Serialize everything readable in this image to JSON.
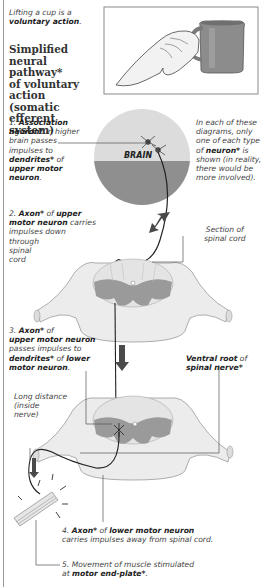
{
  "intro": {
    "line1": "Lifting a cup is a",
    "line2_bold": "voluntary action",
    "line2_end": "."
  },
  "title": {
    "lines": [
      "Simplified",
      "neural pathway*",
      "of voluntary",
      "action (somatic",
      "efferent system)"
    ]
  },
  "brain_label": "BRAIN",
  "note": {
    "l1": "In each of these",
    "l2": "diagrams, only",
    "l3": "one of each type",
    "l4_pre": "of ",
    "l4_bold": "neuron*",
    "l4_post": " is",
    "l5": "shown (in reality,",
    "l6": "there would be",
    "l7": "more involved)."
  },
  "step1": {
    "num": "1. ",
    "b1": "Association",
    "b2": "neuron*",
    "t2": " in higher",
    "t3": "brain passes",
    "t4": "impulses to",
    "b5": "dendrites*",
    "t5": " of",
    "b6": "upper motor",
    "b7": "neuron",
    "t7": "."
  },
  "step2": {
    "num": "2. ",
    "b1": "Axon*",
    "t1": " of ",
    "b1b": "upper",
    "b2": "motor neuron",
    "t2": " carries",
    "t3": "impulses down",
    "t4": "through",
    "t5": "spinal",
    "t6": "cord"
  },
  "section_label": {
    "l1": "Section of",
    "l2": "spinal cord"
  },
  "step3": {
    "num": "3. ",
    "b1": "Axon*",
    "t1": " of",
    "b2": "upper motor neuron",
    "t3": "passes impulses to",
    "b4": "dendrites*",
    "t4": " of ",
    "b4b": "lower",
    "b5": "motor neuron",
    "t5": "."
  },
  "ventral": {
    "b1": "Ventral root",
    "t1": " of",
    "b2": "spinal nerve*"
  },
  "long_distance": {
    "l1": "Long distance",
    "l2": "(inside",
    "l3": "nerve)"
  },
  "step4": {
    "num": "4. ",
    "b1": "Axon*",
    "t1": " of ",
    "b2": "lower motor neuron",
    "t2": "carries impulses away from spinal cord."
  },
  "step5": {
    "t1": "5. Movement of muscle stimulated",
    "t2": "at ",
    "b2": "motor end-plate*",
    "t2end": "."
  },
  "colors": {
    "brain_top": "#dcdcdc",
    "brain_bottom": "#8f8f8f",
    "grey_matter": "#9a9a9a",
    "white_matter": "#ececec",
    "arrow": "#4a4a4a",
    "leader": "#555555"
  }
}
